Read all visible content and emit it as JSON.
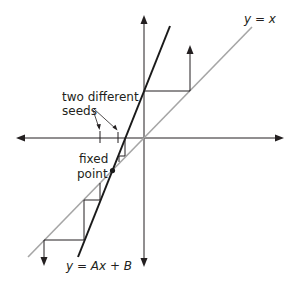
{
  "diagram": {
    "type": "cobweb-plot",
    "labels": {
      "identity_line": "y = x",
      "map_line": "y = Ax + B",
      "seeds_line1": "two different",
      "seeds_line2": "seeds",
      "fixed_line1": "fixed",
      "fixed_line2": "point"
    },
    "colors": {
      "axes": "#231f20",
      "identity_line": "#a6a6a6",
      "map_line": "#1a1a1a",
      "cobweb": "#231f20",
      "text": "#231f20"
    },
    "elements": {
      "axes": [
        "x-axis (horizontal, arrows both ends)",
        "y-axis (vertical, arrows both ends)"
      ],
      "lines": [
        "identity line y = x (gray)",
        "map line y = Ax + B (black, steep slope)"
      ],
      "fixed_point": "intersection of y = x and y = Ax + B, marked with a dot",
      "cobwebs": [
        "seed right of fixed point: iterates diverge upward (arrow up)",
        "seed left of fixed point: iterates diverge downward (arrow down)"
      ]
    }
  }
}
